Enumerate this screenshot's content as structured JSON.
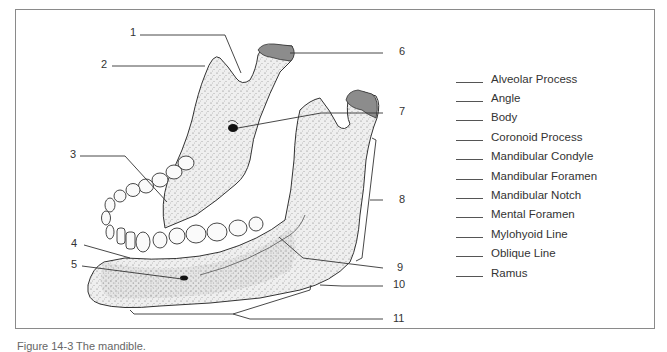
{
  "figure": {
    "caption": "Figure 14-3  The mandible.",
    "bone_fill": "#ececec",
    "condyle_fill": "#8c8c8c",
    "line_color": "#333333"
  },
  "numbers": [
    {
      "id": 1,
      "label": "1"
    },
    {
      "id": 2,
      "label": "2"
    },
    {
      "id": 3,
      "label": "3"
    },
    {
      "id": 4,
      "label": "4"
    },
    {
      "id": 5,
      "label": "5"
    },
    {
      "id": 6,
      "label": "6"
    },
    {
      "id": 7,
      "label": "7"
    },
    {
      "id": 8,
      "label": "8"
    },
    {
      "id": 9,
      "label": "9"
    },
    {
      "id": 10,
      "label": "10"
    },
    {
      "id": 11,
      "label": "11"
    }
  ],
  "terms": [
    {
      "label": "Alveolar Process",
      "answer": ""
    },
    {
      "label": "Angle",
      "answer": ""
    },
    {
      "label": "Body",
      "answer": ""
    },
    {
      "label": "Coronoid Process",
      "answer": ""
    },
    {
      "label": "Mandibular Condyle",
      "answer": ""
    },
    {
      "label": "Mandibular Foramen",
      "answer": ""
    },
    {
      "label": "Mandibular Notch",
      "answer": ""
    },
    {
      "label": "Mental Foramen",
      "answer": ""
    },
    {
      "label": "Mylohyoid Line",
      "answer": ""
    },
    {
      "label": "Oblique Line",
      "answer": ""
    },
    {
      "label": "Ramus",
      "answer": ""
    }
  ]
}
